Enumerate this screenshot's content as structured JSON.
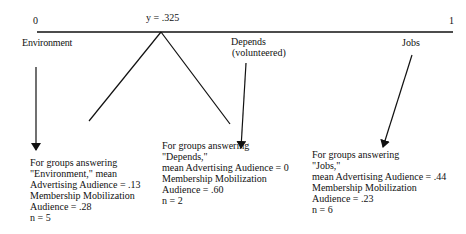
{
  "scale": {
    "left_value": "0",
    "mid_value": "y = .325",
    "right_value": "1"
  },
  "categories": {
    "environment": "Environment",
    "depends": "Depends",
    "depends_note": "(volunteered)",
    "jobs": "Jobs"
  },
  "blocks": {
    "environment": {
      "lines": [
        "For groups answering",
        "\"Environment,\" mean",
        "Advertising Audience = .13",
        "Membership Mobilization",
        "Audience = .28",
        "n = 5"
      ]
    },
    "depends": {
      "lines": [
        "For groups answering",
        "\"Depends,\"",
        "mean Advertising Audience = 0",
        "Membership Mobilization",
        "Audience = .60",
        "n = 2"
      ]
    },
    "jobs": {
      "lines": [
        "For groups answering",
        "\"Jobs,\"",
        "mean Advertising Audience = .44",
        "Membership Mobilization",
        "Audience = .23",
        "n = 6"
      ]
    }
  },
  "colors": {
    "ink": "#111111",
    "background": "#ffffff"
  }
}
